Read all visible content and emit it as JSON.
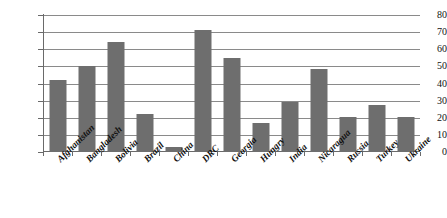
{
  "chart_data": {
    "type": "bar",
    "title": "",
    "subtitle": "",
    "xlabel": "",
    "ylabel": "",
    "ylim": [
      0,
      80
    ],
    "ytick_step": 10,
    "yticks": [
      80,
      70,
      60,
      50,
      40,
      30,
      20,
      10,
      0
    ],
    "grid": true,
    "legend": "none",
    "bar_color": "#6e6e6e",
    "gridline_color": "#8a8a8a",
    "axis_color": "#6a6a6a",
    "categories": [
      "Afghanistan",
      "Bangladesh",
      "Bolivia",
      "Brazil",
      "China",
      "DRC",
      "Georgia",
      "Hungry",
      "India",
      "Nicaragua",
      "Russia",
      "Turkey",
      "Ukraine"
    ],
    "values": [
      42,
      50,
      64,
      22,
      3,
      71,
      55,
      17,
      29,
      48.5,
      20.5,
      27.5,
      20.5
    ]
  }
}
